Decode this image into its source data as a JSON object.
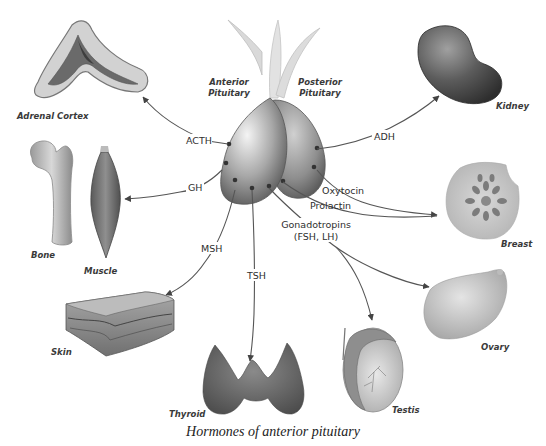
{
  "diagram": {
    "caption": "Hormones of anterior pituitary",
    "glands": {
      "anterior": "Anterior Pituitary",
      "anterior_line1": "Anterior",
      "anterior_line2": "Pituitary",
      "posterior_line1": "Posterior",
      "posterior_line2": "Pituitary"
    },
    "hormones": {
      "acth": "ACTH",
      "gh": "GH",
      "msh": "MSH",
      "tsh": "TSH",
      "adh": "ADH",
      "oxytocin": "Oxytocin",
      "prolactin": "Prolactin",
      "gonadotropins_line1": "Gonadotropins",
      "gonadotropins_line2": "(FSH, LH)"
    },
    "targets": {
      "adrenal_cortex": "Adrenal Cortex",
      "bone": "Bone",
      "muscle": "Muscle",
      "skin": "Skin",
      "thyroid": "Thyroid",
      "kidney": "Kidney",
      "breast": "Breast",
      "ovary": "Ovary",
      "testis": "Testis"
    },
    "edges": [
      {
        "from": "Anterior Pituitary",
        "label": "ACTH",
        "to": "Adrenal Cortex"
      },
      {
        "from": "Anterior Pituitary",
        "label": "GH",
        "to": "Bone / Muscle"
      },
      {
        "from": "Anterior Pituitary",
        "label": "MSH",
        "to": "Skin"
      },
      {
        "from": "Anterior Pituitary",
        "label": "TSH",
        "to": "Thyroid"
      },
      {
        "from": "Anterior Pituitary",
        "label": "Prolactin",
        "to": "Breast"
      },
      {
        "from": "Anterior Pituitary",
        "label": "Gonadotropins (FSH, LH)",
        "to": "Testis"
      },
      {
        "from": "Anterior Pituitary",
        "label": "Gonadotropins (FSH, LH)",
        "to": "Ovary"
      },
      {
        "from": "Posterior Pituitary",
        "label": "ADH",
        "to": "Kidney"
      },
      {
        "from": "Posterior Pituitary",
        "label": "Oxytocin",
        "to": "Breast"
      }
    ]
  }
}
